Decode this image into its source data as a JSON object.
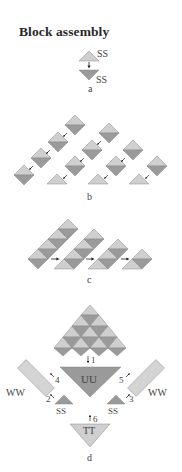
{
  "title": "Block assembly",
  "colors": {
    "light": "#cfcfcf",
    "dark": "#9a9a9a",
    "medium": "#b3b3b3",
    "edge": "#8a8a8a",
    "arrow": "#222222",
    "text": "#444444"
  },
  "panels": {
    "a": {
      "label": "a",
      "units": [
        {
          "shape": "triangle-up",
          "shade": "light",
          "label": "SS"
        },
        {
          "shape": "triangle-down",
          "shade": "dark",
          "label": "SS"
        }
      ]
    },
    "b": {
      "label": "b",
      "columns": 4,
      "description": "half-square diamonds joined into diagonal rows, each row ending in a light triangle"
    },
    "c": {
      "label": "c",
      "rows": 4,
      "description": "diagonal rows joined into strips, arrows pointing right"
    },
    "d": {
      "label": "d",
      "center_block": "UU",
      "side_blocks": [
        "WW",
        "WW"
      ],
      "corner_blocks": [
        "SS",
        "SS"
      ],
      "bottom_block": "TT",
      "steps": [
        "1",
        "2",
        "3",
        "4",
        "5",
        "6"
      ]
    }
  }
}
